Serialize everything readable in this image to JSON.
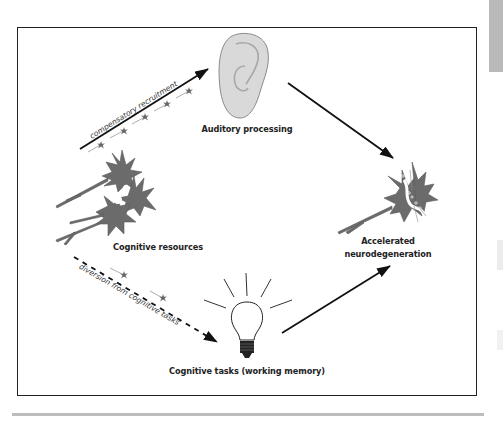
{
  "diagram": {
    "nodes": {
      "auditory": {
        "label": "Auditory processing",
        "icon": "ear-icon"
      },
      "cognitive_resources": {
        "label": "Cognitive resources",
        "icon": "neurons-cluster-icon"
      },
      "neurodegeneration": {
        "label_line1": "Accelerated",
        "label_line2": "neurodegeneration",
        "icon": "degenerating-neuron-icon"
      },
      "cognitive_tasks": {
        "label": "Cognitive tasks (working memory)",
        "icon": "lightbulb-icon"
      }
    },
    "edges": [
      {
        "from": "cognitive_resources",
        "to": "auditory",
        "style": "solid",
        "label": "compensatory recruitment"
      },
      {
        "from": "auditory",
        "to": "neurodegeneration",
        "style": "solid",
        "label": ""
      },
      {
        "from": "cognitive_resources",
        "to": "cognitive_tasks",
        "style": "dashed",
        "label": "diversion from cognitive tasks"
      },
      {
        "from": "cognitive_tasks",
        "to": "neurodegeneration",
        "style": "solid",
        "label": ""
      }
    ],
    "colors": {
      "neuron_fill": "#6b6b6b",
      "ear_fill": "#d9d9d9",
      "arrow": "#111111",
      "frame": "#222222"
    }
  }
}
